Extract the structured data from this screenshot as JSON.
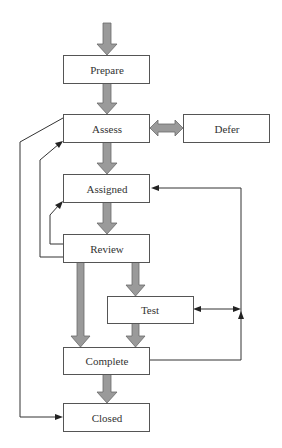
{
  "diagram": {
    "type": "workflow",
    "nodes": [
      {
        "id": "prepare",
        "label": "Prepare"
      },
      {
        "id": "assess",
        "label": "Assess"
      },
      {
        "id": "defer",
        "label": "Defer"
      },
      {
        "id": "assigned",
        "label": "Assigned"
      },
      {
        "id": "review",
        "label": "Review"
      },
      {
        "id": "test",
        "label": "Test"
      },
      {
        "id": "complete",
        "label": "Complete"
      },
      {
        "id": "closed",
        "label": "Closed"
      }
    ],
    "main_flow_edges": [
      {
        "from": "start",
        "to": "prepare"
      },
      {
        "from": "prepare",
        "to": "assess"
      },
      {
        "from": "assess",
        "to": "defer",
        "bidirectional": true
      },
      {
        "from": "assess",
        "to": "assigned"
      },
      {
        "from": "assigned",
        "to": "review"
      },
      {
        "from": "review",
        "to": "test"
      },
      {
        "from": "review",
        "to": "complete"
      },
      {
        "from": "test",
        "to": "complete"
      },
      {
        "from": "complete",
        "to": "closed"
      }
    ],
    "feedback_edges": [
      {
        "from": "assess",
        "to": "closed"
      },
      {
        "from": "review",
        "to": "assess"
      },
      {
        "from": "review",
        "to": "assigned"
      },
      {
        "from": "test",
        "to": "assigned",
        "bidirectional": true
      },
      {
        "from": "complete",
        "to": "assigned"
      }
    ],
    "colors": {
      "main_arrow_fill": "#9a9a9a",
      "main_arrow_stroke": "#6a6a6a",
      "box_border": "#555555",
      "feedback_line": "#333333"
    }
  }
}
